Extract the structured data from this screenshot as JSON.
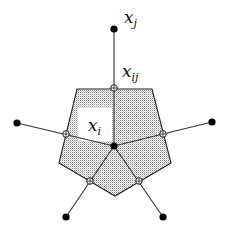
{
  "diagram": {
    "type": "voronoi-cell-with-neighbors",
    "colors": {
      "stroke": "#222222",
      "fill_dots": "#8a8a8a",
      "node": "#000000",
      "background": "#ffffff"
    },
    "center_node": {
      "id": "x_i",
      "label": "x",
      "subscript": "i",
      "x": 114,
      "y": 146
    },
    "neighbors": [
      {
        "id": "x_j",
        "label": "x",
        "subscript": "j",
        "x": 114,
        "y": 29,
        "midpoint": {
          "x": 114,
          "y": 88,
          "label": "x",
          "subscript": "ij"
        }
      },
      {
        "id": "n_left",
        "x": 17,
        "y": 123,
        "midpoint": {
          "x": 66,
          "y": 134
        }
      },
      {
        "id": "n_right",
        "x": 212,
        "y": 122,
        "midpoint": {
          "x": 163,
          "y": 134
        }
      },
      {
        "id": "n_bottom_left",
        "x": 66,
        "y": 217,
        "midpoint": {
          "x": 90,
          "y": 181
        }
      },
      {
        "id": "n_bottom_right",
        "x": 163,
        "y": 217,
        "midpoint": {
          "x": 139,
          "y": 181
        }
      }
    ],
    "cell_polygon": [
      {
        "x": 77,
        "y": 89
      },
      {
        "x": 152,
        "y": 89
      },
      {
        "x": 171,
        "y": 163
      },
      {
        "x": 115,
        "y": 196
      },
      {
        "x": 59,
        "y": 163
      }
    ],
    "labels": {
      "xj": {
        "base": "x",
        "sub": "j"
      },
      "xij": {
        "base": "x",
        "sub": "ij"
      },
      "xi": {
        "base": "x",
        "sub": "i"
      }
    }
  }
}
